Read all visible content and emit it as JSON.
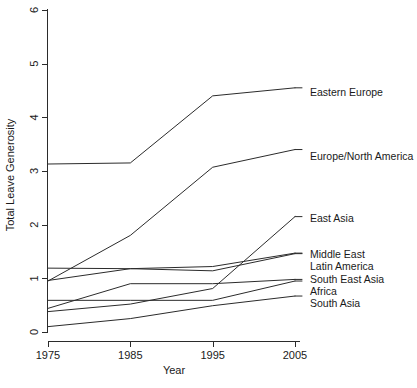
{
  "chart_data": {
    "type": "line",
    "title": "",
    "xlabel": "Year",
    "ylabel": "Total Leave Generosity",
    "x": [
      1975,
      1985,
      1995,
      2005
    ],
    "xtick_labels": [
      "1975",
      "1985",
      "1995",
      "2005"
    ],
    "ytick_labels": [
      "0",
      "1",
      "2",
      "3",
      "4",
      "5",
      "6"
    ],
    "ytick_values": [
      0,
      1,
      2,
      3,
      4,
      5,
      6
    ],
    "xlim": [
      1975,
      2005
    ],
    "ylim": [
      0,
      6
    ],
    "grid": false,
    "legend_position": "right-inline",
    "series": [
      {
        "name": "Eastern Europe",
        "values": [
          3.13,
          3.15,
          4.4,
          4.55
        ],
        "label_x": 310,
        "label_y": 86
      },
      {
        "name": "Europe/North America",
        "values": [
          0.95,
          1.8,
          3.07,
          3.4
        ],
        "label_x": 310,
        "label_y": 150
      },
      {
        "name": "East Asia",
        "values": [
          0.38,
          0.52,
          0.81,
          2.15
        ],
        "label_x": 310,
        "label_y": 212
      },
      {
        "name": "Middle East",
        "values": [
          0.96,
          1.18,
          1.22,
          1.47
        ],
        "label_x": 310,
        "label_y": 248
      },
      {
        "name": "Latin America",
        "values": [
          1.19,
          1.18,
          1.14,
          1.46
        ],
        "label_x": 310,
        "label_y": 260
      },
      {
        "name": "South East Asia",
        "values": [
          0.44,
          0.9,
          0.9,
          0.98
        ],
        "label_x": 310,
        "label_y": 273
      },
      {
        "name": "Africa",
        "values": [
          0.59,
          0.59,
          0.59,
          0.95
        ],
        "label_x": 310,
        "label_y": 285
      },
      {
        "name": "South Asia",
        "values": [
          0.1,
          0.25,
          0.49,
          0.67
        ],
        "label_x": 310,
        "label_y": 297
      }
    ]
  }
}
